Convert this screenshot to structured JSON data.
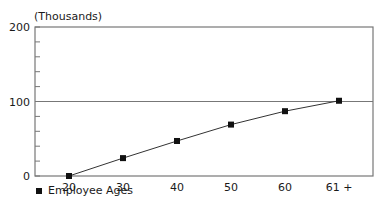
{
  "chart_data": {
    "type": "line",
    "title": "",
    "ylabel": "(Thousands)",
    "xlabel": "",
    "categories": [
      "20",
      "30",
      "40",
      "50",
      "60",
      "61 +"
    ],
    "series": [
      {
        "name": "Employee Ages",
        "values": [
          0,
          24,
          47,
          69,
          87,
          101
        ]
      }
    ],
    "ylim": [
      0,
      200
    ],
    "yticks": [
      "0",
      "100",
      "200"
    ],
    "minor_tick_step": 20,
    "grid": "reference line at 100",
    "legend_position": "bottom-left",
    "colors": {
      "line": "#333333",
      "marker": "#111111",
      "axis": "#777777"
    }
  },
  "legend": {
    "label": "Employee Ages"
  },
  "axis": {
    "unit_label": "(Thousands)"
  }
}
